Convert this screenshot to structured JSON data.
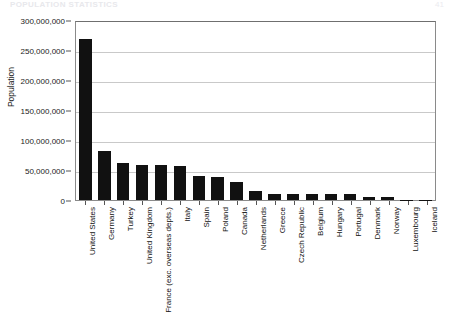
{
  "page": {
    "header": "POPULATION STATISTICS",
    "number": "41"
  },
  "chart_data": {
    "type": "bar",
    "title": "",
    "xlabel": "",
    "ylabel": "Population",
    "ylim": [
      0,
      300000000
    ],
    "ytick_step": 50000000,
    "ytick_labels": [
      "300,000,000",
      "250,000,000",
      "200,000,000",
      "150,000,000",
      "100,000,000",
      "50,000,000",
      "0"
    ],
    "ytick_values": [
      300000000,
      250000000,
      200000000,
      150000000,
      100000000,
      50000000,
      0
    ],
    "grid": true,
    "legend": false,
    "bar_color": "#111111",
    "categories": [
      "United States",
      "Germany",
      "Turkey",
      "United Kingdom",
      "France (exc. overseas depts.)",
      "Italy",
      "Spain",
      "Poland",
      "Canada",
      "Netherlands",
      "Greece",
      "Czech Republic",
      "Belgium",
      "Hungary",
      "Portugal",
      "Denmark",
      "Norway",
      "Luxembourg",
      "Iceland"
    ],
    "values": [
      268000000,
      82000000,
      62000000,
      59000000,
      58500000,
      57500000,
      39500000,
      38500000,
      30500000,
      15500000,
      10500000,
      10300000,
      10200000,
      10100000,
      9900000,
      5300000,
      4400000,
      420000,
      270000
    ]
  }
}
